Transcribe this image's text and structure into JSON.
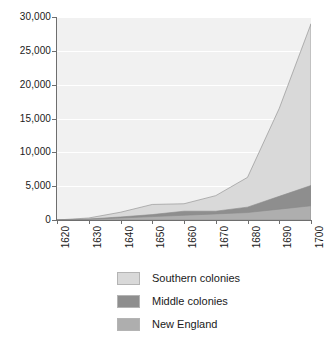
{
  "chart_data": {
    "type": "area",
    "stacked": true,
    "title": "",
    "subtitle": "",
    "xlabel": "",
    "ylabel": "",
    "x": [
      1620,
      1630,
      1640,
      1650,
      1660,
      1670,
      1680,
      1690,
      1700
    ],
    "xlim": [
      1620,
      1700
    ],
    "ylim": [
      0,
      30000
    ],
    "xticks": [
      "1620",
      "1630",
      "1640",
      "1650",
      "1660",
      "1670",
      "1680",
      "1690",
      "1700"
    ],
    "yticks": [
      "0",
      "5,000",
      "10,000",
      "15,000",
      "20,000",
      "25,000",
      "30,000"
    ],
    "ytick_values": [
      0,
      5000,
      10000,
      15000,
      20000,
      25000,
      30000
    ],
    "grid": "horizontal",
    "legend_position": "bottom",
    "series": [
      {
        "name": "New England",
        "color": "#aeaeae",
        "values": [
          0,
          100,
          300,
          500,
          700,
          900,
          1100,
          1600,
          2100
        ]
      },
      {
        "name": "Middle colonies",
        "color": "#8e8e8e",
        "values": [
          0,
          50,
          150,
          300,
          600,
          400,
          800,
          1900,
          3000
        ]
      },
      {
        "name": "Southern colonies",
        "color": "#d9d9d9",
        "values": [
          0,
          150,
          700,
          1500,
          1100,
          2300,
          4400,
          13000,
          23900
        ]
      }
    ],
    "totals": [
      0,
      300,
      1150,
      2300,
      2400,
      3600,
      6300,
      16500,
      29000
    ],
    "annotations": [],
    "colors": {
      "plot_background": "#f1f1f1",
      "gridline": "#ffffff",
      "axis": "#6e6e6e",
      "text": "#1a1a1a",
      "page_background": "#ffffff"
    }
  },
  "legend": {
    "items": [
      {
        "label": "Southern colonies",
        "swatch": "#d9d9d9"
      },
      {
        "label": "Middle colonies",
        "swatch": "#8e8e8e"
      },
      {
        "label": "New England",
        "swatch": "#aeaeae"
      }
    ]
  }
}
